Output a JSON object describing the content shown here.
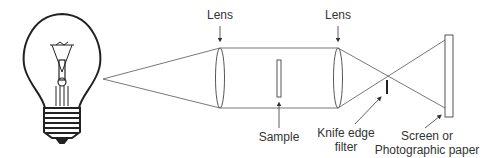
{
  "diagram": {
    "labels": {
      "lens1": "Lens",
      "lens2": "Lens",
      "sample": "Sample",
      "knife_line1": "Knife edge",
      "knife_line2": "filter",
      "screen_line1": "Screen or",
      "screen_line2": "Photographic paper"
    },
    "components": [
      "light-bulb",
      "lens",
      "sample",
      "lens",
      "knife-edge-filter",
      "screen"
    ],
    "colors": {
      "stroke": "#444444",
      "text": "#333333"
    }
  }
}
